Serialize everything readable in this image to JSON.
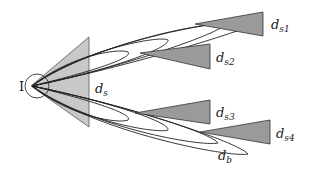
{
  "diagram": {
    "type": "beam-lobe diagram",
    "origin_label": "I",
    "source_beam_label": "d",
    "source_beam_sub": "s",
    "beams": [
      {
        "id": "ds1",
        "label": "d",
        "sub": "s1"
      },
      {
        "id": "ds2",
        "label": "d",
        "sub": "s2"
      },
      {
        "id": "ds3",
        "label": "d",
        "sub": "s3"
      },
      {
        "id": "ds4",
        "label": "d",
        "sub": "s4"
      }
    ],
    "lobe_label": "d",
    "lobe_sub": "b",
    "colors": {
      "fill_light": "#c8c8c8",
      "fill_dark": "#9a9a9a",
      "stroke": "#333333"
    }
  }
}
